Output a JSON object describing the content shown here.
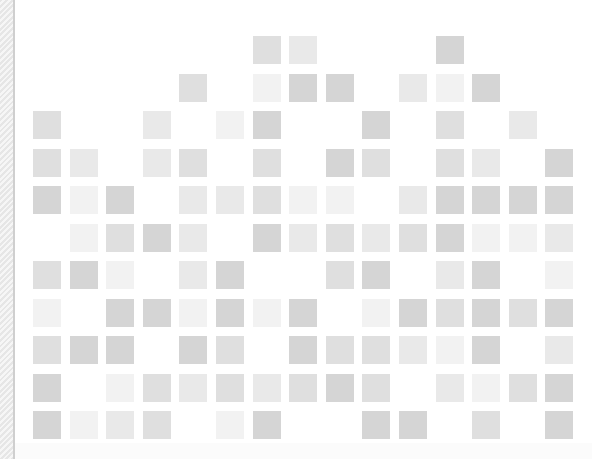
{
  "grid": {
    "origin_x": 33,
    "origin_y": 36,
    "pitch_x": 36.6,
    "pitch_y": 37.5,
    "columns": 15,
    "rows": 11,
    "palette": {
      "d": "#d5d5d5",
      "m": "#dfdfdf",
      "l": "#e9e9e9",
      "v": "#f2f2f2"
    },
    "tiles": [
      "......ml...d...",
      "....m.vdd.lvd..",
      "m..l.vd..d.m.l.",
      "ml.lm.m.dm.ml.d",
      "dvd.llmvv.ldddd",
      ".vmdl.dlmlmdvvl",
      "mdv.ld..md.ld.v",
      "v.ddvdvd.vdmdmd",
      "mdd.dm.dmmlvd.lm",
      "d.vmlmlmdm.lvmd.",
      "dvlm.vd..dd.m.d"
    ]
  }
}
